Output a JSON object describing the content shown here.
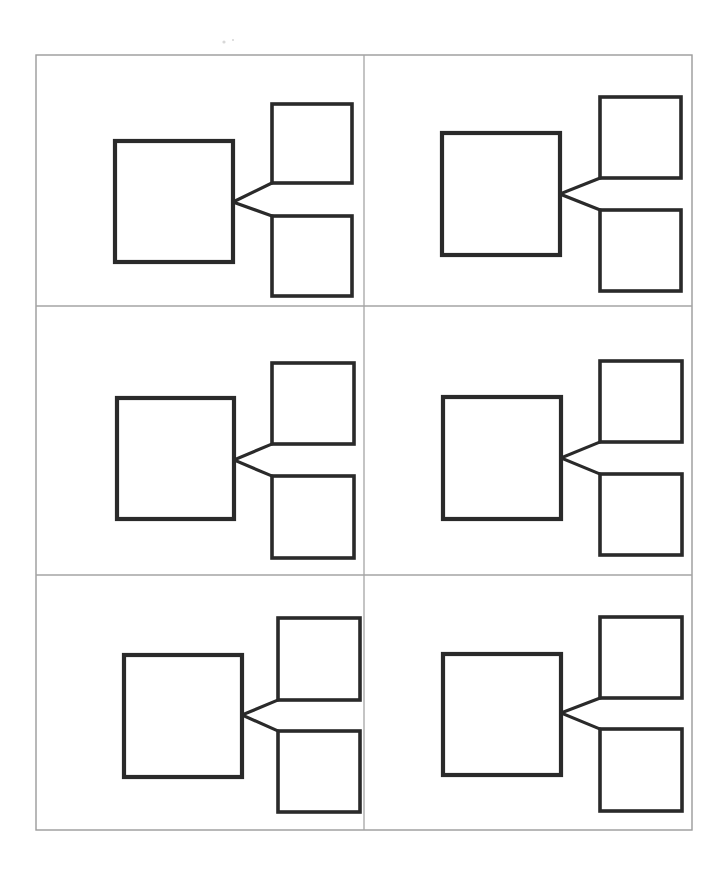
{
  "document": {
    "kind": "scanned-worksheet",
    "title": "Blank concept map grid",
    "page_width": 726,
    "page_height": 873,
    "background_color": "#ffffff",
    "ink_color": "#2a2a2a",
    "frame_color": "#9b9b9b",
    "divider_color": "#a5a5a5",
    "cell_count": 6,
    "rows": 3,
    "columns": 2,
    "has_text": false,
    "caption": ""
  },
  "frame": {
    "x": 36,
    "y": 55,
    "width": 656,
    "height": 775,
    "stroke_width": 1.4
  },
  "dividers": {
    "vertical_x": [
      364
    ],
    "horizontal_y": [
      306,
      575
    ]
  },
  "diagram_template": {
    "name": "one-to-two-branch",
    "primary_box_label": "",
    "secondary_box_top_label": "",
    "secondary_box_bottom_label": "",
    "connector_count": 2,
    "junction_on": "primary-right-edge",
    "branch_targets": [
      "top-box-bottom-left-corner",
      "bottom-box-top-left-corner"
    ]
  },
  "cells": [
    {
      "id": "cell-1",
      "position": "row-1-col-1",
      "primary_box": {
        "x": 115,
        "y": 141,
        "width": 118,
        "height": 121
      },
      "top_box": {
        "x": 272,
        "y": 104,
        "width": 80,
        "height": 79
      },
      "bottom_box": {
        "x": 272,
        "y": 216,
        "width": 80,
        "height": 80
      },
      "junction": {
        "x": 233,
        "y": 202
      }
    },
    {
      "id": "cell-2",
      "position": "row-1-col-2",
      "primary_box": {
        "x": 442,
        "y": 133,
        "width": 118,
        "height": 122
      },
      "top_box": {
        "x": 600,
        "y": 97,
        "width": 81,
        "height": 81
      },
      "bottom_box": {
        "x": 600,
        "y": 210,
        "width": 81,
        "height": 81
      },
      "junction": {
        "x": 560,
        "y": 194
      }
    },
    {
      "id": "cell-3",
      "position": "row-2-col-1",
      "primary_box": {
        "x": 117,
        "y": 398,
        "width": 117,
        "height": 121
      },
      "top_box": {
        "x": 272,
        "y": 363,
        "width": 82,
        "height": 81
      },
      "bottom_box": {
        "x": 272,
        "y": 476,
        "width": 82,
        "height": 82
      },
      "junction": {
        "x": 234,
        "y": 460
      }
    },
    {
      "id": "cell-4",
      "position": "row-2-col-2",
      "primary_box": {
        "x": 443,
        "y": 397,
        "width": 118,
        "height": 122
      },
      "top_box": {
        "x": 600,
        "y": 361,
        "width": 82,
        "height": 81
      },
      "bottom_box": {
        "x": 600,
        "y": 474,
        "width": 82,
        "height": 81
      },
      "junction": {
        "x": 561,
        "y": 458
      }
    },
    {
      "id": "cell-5",
      "position": "row-3-col-1",
      "primary_box": {
        "x": 124,
        "y": 655,
        "width": 118,
        "height": 122
      },
      "top_box": {
        "x": 278,
        "y": 618,
        "width": 82,
        "height": 82
      },
      "bottom_box": {
        "x": 278,
        "y": 731,
        "width": 82,
        "height": 81
      },
      "junction": {
        "x": 242,
        "y": 715
      }
    },
    {
      "id": "cell-6",
      "position": "row-3-col-2",
      "primary_box": {
        "x": 443,
        "y": 654,
        "width": 118,
        "height": 121
      },
      "top_box": {
        "x": 600,
        "y": 617,
        "width": 82,
        "height": 81
      },
      "bottom_box": {
        "x": 600,
        "y": 729,
        "width": 82,
        "height": 82
      },
      "junction": {
        "x": 561,
        "y": 713
      }
    }
  ],
  "artifacts": {
    "specks": [
      {
        "x": 224,
        "y": 42,
        "r": 1.6
      },
      {
        "x": 233,
        "y": 40,
        "r": 1.1
      }
    ]
  }
}
